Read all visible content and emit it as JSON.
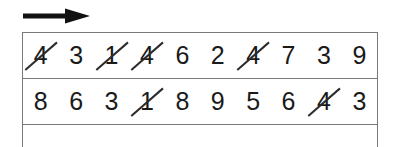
{
  "worksheet": {
    "title": "Number cancellation worksheet",
    "direction_arrow": {
      "icon": "arrow-right-icon",
      "label": "scan direction left to right",
      "color": "#111111"
    },
    "grid": {
      "border_color": "#7a7a7a",
      "digit_color": "#1a1a1a",
      "strike_color": "#2b2b2b",
      "columns": 10,
      "rows": [
        {
          "row_label": "row-1",
          "cells": [
            {
              "value": "4",
              "struck": true
            },
            {
              "value": "3",
              "struck": false
            },
            {
              "value": "1",
              "struck": true
            },
            {
              "value": "4",
              "struck": true
            },
            {
              "value": "6",
              "struck": false
            },
            {
              "value": "2",
              "struck": false
            },
            {
              "value": "4",
              "struck": true
            },
            {
              "value": "7",
              "struck": false
            },
            {
              "value": "3",
              "struck": false
            },
            {
              "value": "9",
              "struck": false
            }
          ]
        },
        {
          "row_label": "row-2",
          "cells": [
            {
              "value": "8",
              "struck": false
            },
            {
              "value": "6",
              "struck": false
            },
            {
              "value": "3",
              "struck": false
            },
            {
              "value": "1",
              "struck": true
            },
            {
              "value": "8",
              "struck": false
            },
            {
              "value": "9",
              "struck": false
            },
            {
              "value": "5",
              "struck": false
            },
            {
              "value": "6",
              "struck": false
            },
            {
              "value": "4",
              "struck": true
            },
            {
              "value": "3",
              "struck": false
            }
          ]
        },
        {
          "row_label": "row-3-partial",
          "partial": true,
          "cells": [
            {
              "value": "",
              "struck": false
            },
            {
              "value": "",
              "struck": false
            },
            {
              "value": "",
              "struck": false
            },
            {
              "value": "",
              "struck": false
            },
            {
              "value": "",
              "struck": false
            },
            {
              "value": "",
              "struck": false
            },
            {
              "value": "",
              "struck": false
            },
            {
              "value": "",
              "struck": false
            },
            {
              "value": "",
              "struck": false
            },
            {
              "value": "",
              "struck": false
            }
          ]
        }
      ]
    }
  }
}
